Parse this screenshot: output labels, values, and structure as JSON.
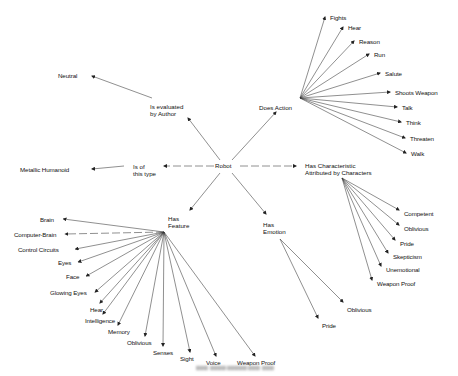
{
  "diagram": {
    "center": {
      "label": "Robot",
      "x": 225,
      "y": 166
    },
    "relations": [
      {
        "id": "evaluated",
        "label_lines": [
          "Is evaluated",
          "by Author"
        ],
        "x": 150,
        "y": 103,
        "targets": [
          {
            "label": "Neutral",
            "x": 58,
            "y": 72
          }
        ]
      },
      {
        "id": "does-action",
        "label_lines": [
          "Does Action"
        ],
        "x": 259,
        "y": 104,
        "targets": [
          {
            "label": "Fights",
            "x": 330,
            "y": 14
          },
          {
            "label": "Hear",
            "x": 348,
            "y": 24
          },
          {
            "label": "Reason",
            "x": 359,
            "y": 38
          },
          {
            "label": "Run",
            "x": 374,
            "y": 51
          },
          {
            "label": "Salute",
            "x": 385,
            "y": 70
          },
          {
            "label": "Shoots Weapon",
            "x": 395,
            "y": 89
          },
          {
            "label": "Talk",
            "x": 402,
            "y": 104
          },
          {
            "label": "Think",
            "x": 406,
            "y": 119
          },
          {
            "label": "Threaten",
            "x": 410,
            "y": 135
          },
          {
            "label": "Walk",
            "x": 411,
            "y": 150
          }
        ]
      },
      {
        "id": "of-type",
        "label_lines": [
          "Is of",
          "this type"
        ],
        "x": 133,
        "y": 163,
        "targets": [
          {
            "label": "Metallic Humanoid",
            "x": 20,
            "y": 166
          }
        ]
      },
      {
        "id": "characteristic",
        "label_lines": [
          "Has Characteristic",
          "Attributed by Characters"
        ],
        "x": 305,
        "y": 162,
        "targets": [
          {
            "label": "Competent",
            "x": 404,
            "y": 210
          },
          {
            "label": "Oblivious",
            "x": 404,
            "y": 225
          },
          {
            "label": "Pride",
            "x": 400,
            "y": 240
          },
          {
            "label": "Skepticism",
            "x": 393,
            "y": 253
          },
          {
            "label": "Unemotional",
            "x": 386,
            "y": 266
          },
          {
            "label": "Weapon Proof",
            "x": 377,
            "y": 280
          }
        ]
      },
      {
        "id": "feature",
        "label_lines": [
          "Has",
          "Feature"
        ],
        "x": 168,
        "y": 215,
        "targets": [
          {
            "label": "Brain",
            "x": 40,
            "y": 216
          },
          {
            "label": "Computer-Brain",
            "x": 14,
            "y": 231
          },
          {
            "label": "Control Circuits",
            "x": 18,
            "y": 246
          },
          {
            "label": "Eyes",
            "x": 58,
            "y": 259
          },
          {
            "label": "Face",
            "x": 66,
            "y": 273
          },
          {
            "label": "Glowing Eyes",
            "x": 50,
            "y": 289
          },
          {
            "label": "Hear",
            "x": 90,
            "y": 306
          },
          {
            "label": "Intelligence",
            "x": 85,
            "y": 317
          },
          {
            "label": "Memory",
            "x": 108,
            "y": 328
          },
          {
            "label": "Oblivious",
            "x": 127,
            "y": 339
          },
          {
            "label": "Senses",
            "x": 153,
            "y": 349
          },
          {
            "label": "Sight",
            "x": 180,
            "y": 355
          },
          {
            "label": "Voice",
            "x": 206,
            "y": 359
          },
          {
            "label": "Weapon Proof",
            "x": 237,
            "y": 359
          }
        ]
      },
      {
        "id": "emotion",
        "label_lines": [
          "Has",
          "Emotion"
        ],
        "x": 263,
        "y": 221,
        "targets": [
          {
            "label": "Oblivious",
            "x": 347,
            "y": 306
          },
          {
            "label": "Pride",
            "x": 322,
            "y": 322
          }
        ]
      }
    ],
    "caption": "(illegible blurred caption)"
  }
}
